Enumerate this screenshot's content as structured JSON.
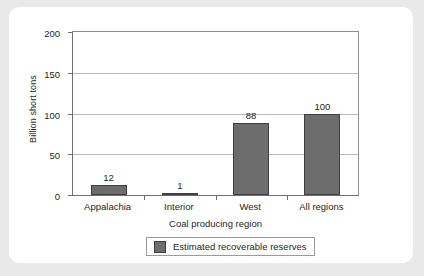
{
  "chart_data": {
    "type": "bar",
    "title": "",
    "subtitle": "",
    "categories": [
      "Appalachia",
      "Interior",
      "West",
      "All regions"
    ],
    "values": [
      12,
      1,
      88,
      100
    ],
    "value_labels": [
      "12",
      "1",
      "88",
      "100"
    ],
    "series": [
      {
        "name": "Estimated recoverable reserves",
        "values": [
          12,
          1,
          88,
          100
        ],
        "color": "#6d6d6d"
      }
    ],
    "xlabel": "Coal producing region",
    "ylabel": "Billion short tons",
    "ylim": [
      0,
      200
    ],
    "yticks": [
      0,
      50,
      100,
      150,
      200
    ],
    "ytick_labels": [
      "0",
      "50",
      "100",
      "150",
      "200"
    ],
    "grid": true,
    "grid_axis": "y",
    "legend": {
      "position": "bottom",
      "entries": [
        {
          "label": "Estimated recoverable reserves",
          "color": "#6d6d6d"
        }
      ]
    },
    "colors": {
      "bar_fill": "#6d6d6d",
      "bar_border": "#3f3f3f",
      "axis": "#6e6e6e",
      "gridline": "#b9b9b9",
      "text": "#231f20",
      "plot_background": "#ffffff",
      "card_background": "#ffffff",
      "page_background": "#e9e9e9"
    }
  }
}
